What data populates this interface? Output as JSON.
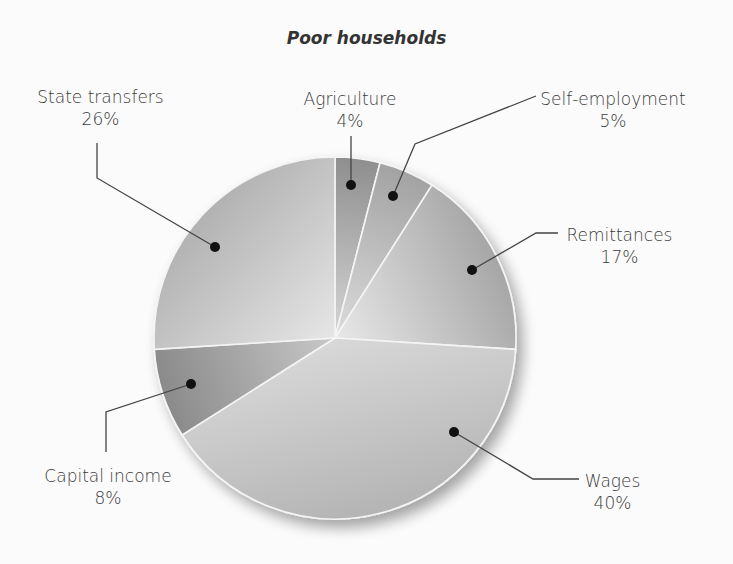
{
  "chart_data": {
    "type": "pie",
    "title": "Poor households",
    "categories": [
      "Agriculture",
      "Self-employment",
      "Remittances",
      "Wages",
      "Capital income",
      "State transfers"
    ],
    "values": [
      4,
      5,
      17,
      40,
      8,
      26
    ],
    "unit": "%",
    "start_angle": "12 o'clock, clockwise",
    "labels": [
      {
        "name": "Agriculture",
        "value": "4%"
      },
      {
        "name": "Self-employment",
        "value": "5%"
      },
      {
        "name": "Remittances",
        "value": "17%"
      },
      {
        "name": "Wages",
        "value": "40%"
      },
      {
        "name": "Capital income",
        "value": "8%"
      },
      {
        "name": "State transfers",
        "value": "26%"
      }
    ],
    "legend": "none (leader-line labels)"
  },
  "style": {
    "slice_colors_outer": [
      "#8e8e8e",
      "#a2a2a2",
      "#a6a6a6",
      "#b4b4b4",
      "#8a8a8a",
      "#b2b2b2"
    ],
    "slice_colors_inner": [
      "#d6d6d6",
      "#dcdcdc",
      "#e8e8e8",
      "#d8d8d8",
      "#c8c8c8",
      "#e6e6e6"
    ],
    "separator": "#f4f4f4",
    "leader": "#444444"
  }
}
